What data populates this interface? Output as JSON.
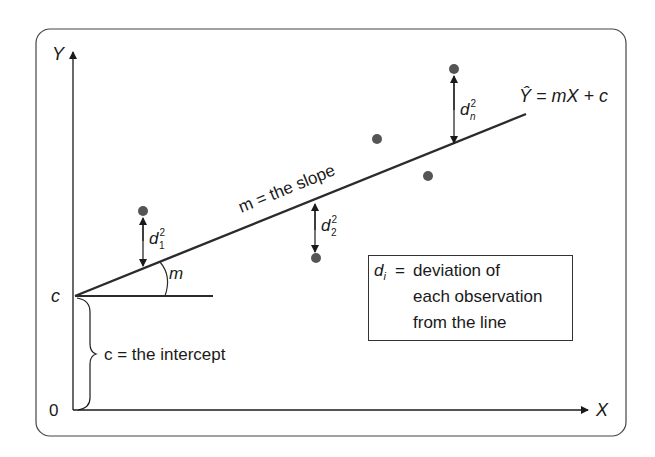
{
  "axes": {
    "y_label": "Y",
    "x_label": "X",
    "origin_label": "0",
    "intercept_tick": "c"
  },
  "labels": {
    "equation": "Ŷ = mX + c",
    "slope": "m = the slope",
    "angle": "m",
    "intercept": "c = the intercept",
    "d1": "d",
    "d1_sup": "2",
    "d1_sub": "1",
    "d2": "d",
    "d2_sup": "2",
    "d2_sub": "2",
    "dn": "d",
    "dn_sup": "2",
    "dn_sub": "n"
  },
  "legend": {
    "symbol": "d",
    "symbol_sub": "i",
    "eq": "=",
    "line1": "deviation of",
    "line2": "each observation",
    "line3": "from the line"
  },
  "colors": {
    "line": "#2b2b2b",
    "points": "#555555",
    "frame": "#444444"
  },
  "points": [
    {
      "x": 143,
      "y": 211
    },
    {
      "x": 316,
      "y": 258
    },
    {
      "x": 377,
      "y": 139
    },
    {
      "x": 428,
      "y": 176
    },
    {
      "x": 454,
      "y": 69
    }
  ]
}
